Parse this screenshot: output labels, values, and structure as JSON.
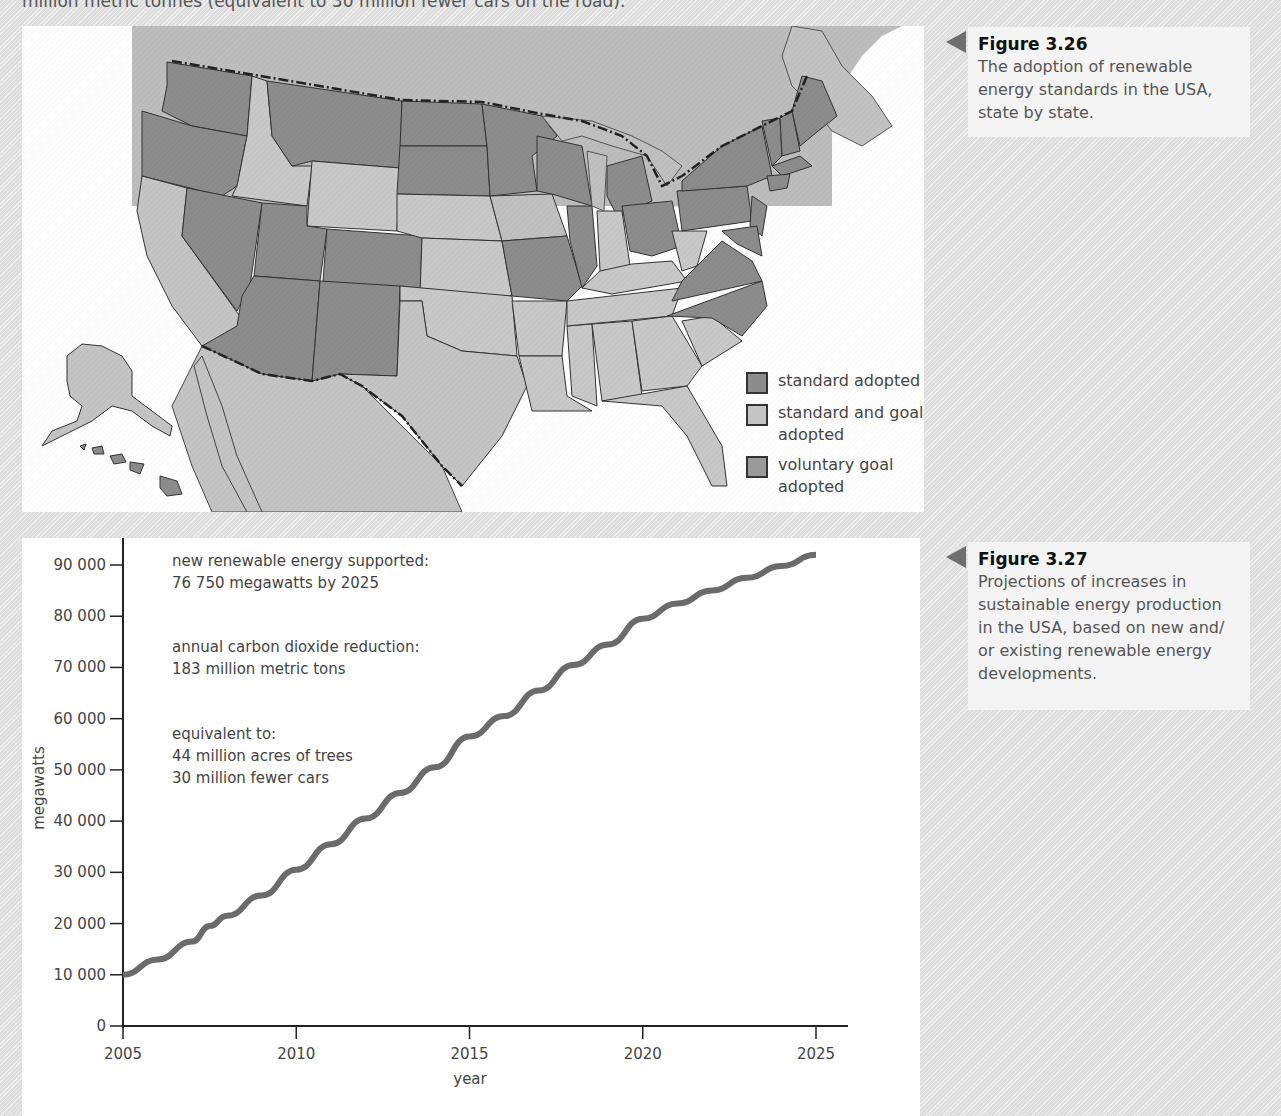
{
  "page": {
    "top_text": "million metric tonnes (equivalent to 30 million fewer cars on the road)."
  },
  "figures": [
    {
      "id": "fig-3-26",
      "title": "Figure 3.26",
      "caption": "The adoption of renewable energy standards in the USA, state by state."
    },
    {
      "id": "fig-3-27",
      "title": "Figure 3.27",
      "caption": "Projections of increases in sustainable energy production in the USA, based on new and/ or existing renewable energy developments."
    }
  ],
  "map": {
    "legend": [
      {
        "label": "standard adopted",
        "color": "#8c8c8c"
      },
      {
        "label": "standard and goal adopted",
        "color": "#c4c4c4"
      },
      {
        "label": "voluntary goal adopted",
        "color": "#9a9a9a"
      }
    ],
    "colors": {
      "standard_adopted": "#8c8c8c",
      "standard_and_goal": "#c8c8c8",
      "neighbour_land": "#bdbdbd",
      "ocean": "#ffffff",
      "border": "#333333"
    }
  },
  "chart": {
    "annotations": [
      {
        "line1": "new renewable energy supported:",
        "line2": "76 750 megawatts by 2025"
      },
      {
        "line1": "annual carbon dioxide reduction:",
        "line2": "183 million metric tons"
      },
      {
        "line1": "equivalent to:",
        "line2": "44 million acres of trees",
        "line3": "30 million fewer cars"
      }
    ],
    "line_color": "#6b6b6b"
  },
  "chart_data": {
    "type": "line",
    "title": "",
    "xlabel": "year",
    "ylabel": "megawatts",
    "x_ticks": [
      "2005",
      "2010",
      "2015",
      "2020",
      "2025"
    ],
    "y_ticks": [
      "0",
      "10 000",
      "20 000",
      "30 000",
      "40 000",
      "50 000",
      "60 000",
      "70 000",
      "80 000",
      "90 000"
    ],
    "xlim": [
      2005,
      2026
    ],
    "ylim": [
      0,
      90000
    ],
    "grid": false,
    "legend": "none",
    "x": [
      2005,
      2006,
      2007,
      2007.5,
      2008,
      2009,
      2010,
      2011,
      2012,
      2013,
      2014,
      2015,
      2016,
      2017,
      2018,
      2019,
      2020,
      2021,
      2022,
      2023,
      2024,
      2025
    ],
    "series": [
      {
        "name": "megawatts",
        "values": [
          10000,
          13000,
          16500,
          19500,
          21500,
          25500,
          30500,
          35500,
          40500,
          45500,
          50500,
          56500,
          60500,
          65500,
          70500,
          74500,
          79500,
          82500,
          85000,
          87500,
          89800,
          92000
        ]
      }
    ]
  }
}
